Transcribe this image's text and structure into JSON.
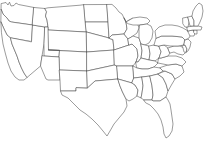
{
  "image": {
    "kind": "outline-map",
    "subject": "Contiguous United States",
    "width": 205,
    "height": 144,
    "has_labels": false,
    "has_legend": false,
    "has_title": false,
    "has_frame": false
  },
  "style": {
    "background_color": "#ffffff",
    "state_fill": "#ffffff",
    "border_color": "#4a4a4a",
    "border_width": 0.55
  },
  "map": {
    "projection_look": "albers-usa",
    "region_count": 49,
    "regions": [
      {
        "id": "WA",
        "name": "Washington",
        "d": "M1.5,3.5 L6,2.5 L8,5 L9.5,2.2 L11,6 L14,5.5 L16,3 L18.5,4.5 L34,7.5 L32.5,25 L11.5,22 L9,21 L7,18 L3,14 L1.2,9.5 Z"
      },
      {
        "id": "OR",
        "name": "Oregon",
        "d": "M1.2,9.5 L3,14 L7,18 L9,21 L11.5,22 L32.5,25 L31.5,41.5 L10.5,38 L7,35 L4,29 L1,22 Z"
      },
      {
        "id": "CA",
        "name": "California",
        "d": "M1,22 L4,29 L7,35 L10.5,38 L12,44 L14.5,50 L17,56 L19,62 L21.5,68 L24,73 L27,77.5 L24,80 L19,80 L15,77 L11,71 L8,63 L5.5,54 L3,44 L1.5,33 Z"
      },
      {
        "id": "NV",
        "name": "Nevada",
        "d": "M31.5,41.5 L32.5,25 L45,27 L44,44 L42,56 L40.5,66 L27,77.5 L24,73 L21.5,68 L19,62 L17,56 L14.5,50 L12,44 L10.5,38 Z"
      },
      {
        "id": "ID",
        "name": "Idaho",
        "d": "M34,7.5 L45,8.5 L46.5,12 L45.5,16 L47,20 L48,27 L45,27 L32.5,25 Z"
      },
      {
        "id": "MT",
        "name": "Montana",
        "d": "M45,8.5 L48,7.8 L80,5.2 L84,4.6 L85.5,22 L86.5,32 L48,30 L48,27 L47,20 L45.5,16 L46.5,12 Z"
      },
      {
        "id": "WY",
        "name": "Wyoming",
        "d": "M48,30 L86.5,32 L87,52 L48.5,50 Z"
      },
      {
        "id": "UT",
        "name": "Utah",
        "d": "M45,27 L48,27 L48,30 L48.5,50 L59.5,50.5 L59,57 L44,56 L44,44 Z"
      },
      {
        "id": "CO",
        "name": "Colorado",
        "d": "M48.5,50 L87,52 L87,71 L59.5,70 L59,57 L59.5,50.5 Z"
      },
      {
        "id": "AZ",
        "name": "Arizona",
        "d": "M44,56 L59,57 L59.5,70 L60,80 L48,80 L46,79 L40.5,66 L42,56 Z"
      },
      {
        "id": "NM",
        "name": "New Mexico",
        "d": "M59.5,70 L87,71 L87.5,88 L76,88 L76,91 L60.5,91 L60,80 Z"
      },
      {
        "id": "ND",
        "name": "North Dakota",
        "d": "M84,4.6 L107,4.5 L108,22 L85.5,22 Z"
      },
      {
        "id": "SD",
        "name": "South Dakota",
        "d": "M85.5,22 L108,22 L109,38 L86.5,32 Z"
      },
      {
        "id": "NE",
        "name": "Nebraska",
        "d": "M86.5,32 L109,38 L113,40 L114,50 L87,52 Z"
      },
      {
        "id": "KS",
        "name": "Kansas",
        "d": "M87,52 L114,50 L114.5,65 L87,71 Z"
      },
      {
        "id": "OK",
        "name": "Oklahoma",
        "d": "M87,71 L114.5,65 L117,66 L118,79 L95,81 L87.5,88 Z"
      },
      {
        "id": "TX",
        "name": "Texas",
        "d": "M87.5,88 L95,81 L118,79 L120,86 L122.5,92 L126,99 L127,106 L124,112 L119,118 L114,124 L110,131 L107,136 L103,131 L98,125 L92,119 L86,114 L80,110 L74,104 L68,98 L62,95 L60.5,91 L76,91 L76,88 Z"
      },
      {
        "id": "MN",
        "name": "Minnesota",
        "d": "M107,4.5 L112,4.4 L116,8 L119,12 L122,14 L124,18 L126,22 L127,29 L124,34 L112,35 L109,38 L108,22 Z"
      },
      {
        "id": "IA",
        "name": "Iowa",
        "d": "M109,38 L112,35 L124,34 L128,39 L129,45 L114,50 L113,40 Z"
      },
      {
        "id": "MO",
        "name": "Missouri",
        "d": "M114,50 L129,45 L132,44 L137,49 L138,56 L136,62 L133,66 L117,66 L114.5,65 Z"
      },
      {
        "id": "AR",
        "name": "Arkansas",
        "d": "M117,66 L133,66 L134,78 L132,83 L118,79 Z"
      },
      {
        "id": "LA",
        "name": "Louisiana",
        "d": "M118,79 L132,83 L135,85 L138,90 L137,96 L133,99 L129,101 L126,99 L122.5,92 L120,86 Z"
      },
      {
        "id": "WI",
        "name": "Wisconsin",
        "d": "M124,18 L126,22 L129,20 L133,18 L137,22 L139,28 L137,33 L133,36 L128,39 L124,34 L127,29 L126,22 Z"
      },
      {
        "id": "IL",
        "name": "Illinois",
        "d": "M128,39 L133,36 L139,38 L141,44 L142,51 L141,58 L138,62 L136,62 L138,56 L137,49 L132,44 L129,45 Z"
      },
      {
        "id": "MI-UP",
        "name": "Michigan Upper Peninsula",
        "d": "M126,22 L133,18 L140,17 L147,18 L150,21 L147,24 L140,25 L133,25 L129,24 Z"
      },
      {
        "id": "MI",
        "name": "Michigan",
        "d": "M140,25 L147,24 L151,26 L153,31 L152,38 L149,43 L145,45 L141,44 L139,38 L139,30 Z"
      },
      {
        "id": "IN",
        "name": "Indiana",
        "d": "M141,44 L145,45 L149,46 L150,54 L149,60 L141,58 L142,51 Z"
      },
      {
        "id": "OH",
        "name": "Ohio",
        "d": "M149,46 L154,45 L159,46 L161,52 L159,58 L155,61 L149,60 L150,54 Z"
      },
      {
        "id": "KY",
        "name": "Kentucky",
        "d": "M136,62 L138,62 L141,58 L149,60 L155,61 L158,63 L154,67 L148,69 L142,69 L137,68 Z"
      },
      {
        "id": "TN",
        "name": "Tennessee",
        "d": "M133,66 L137,68 L142,69 L148,69 L154,67 L160,68 L163,71 L158,74 L150,76 L142,77 L134,78 Z"
      },
      {
        "id": "MS",
        "name": "Mississippi",
        "d": "M134,78 L142,77 L143,86 L142,93 L141,98 L137,96 L138,90 L135,85 L132,83 Z"
      },
      {
        "id": "AL",
        "name": "Alabama",
        "d": "M142,77 L150,76 L152,86 L153,95 L152,100 L144,100 L141,98 L142,93 L143,86 Z"
      },
      {
        "id": "GA",
        "name": "Georgia",
        "d": "M150,76 L158,74 L163,78 L166,84 L168,91 L166,97 L160,101 L153,101 L152,100 L153,95 L152,86 Z"
      },
      {
        "id": "FL",
        "name": "Florida",
        "d": "M144,100 L152,100 L153,101 L160,101 L166,97 L168,100 L170,104 L171,110 L172,117 L173,124 L172,131 L169,136 L166,138 L164,134 L163,127 L161,120 L158,114 L154,109 L150,105 L146,103 Z"
      },
      {
        "id": "SC",
        "name": "South Carolina",
        "d": "M158,74 L165,71 L172,74 L175,79 L172,84 L168,91 L166,84 L163,78 Z"
      },
      {
        "id": "NC",
        "name": "North Carolina",
        "d": "M160,68 L163,71 L165,71 L172,74 L175,79 L180,76 L184,72 L182,66 L176,64 L168,65 Z"
      },
      {
        "id": "VA",
        "name": "Virginia",
        "d": "M158,63 L168,65 L176,64 L182,66 L186,62 L182,58 L176,56 L168,56 L161,58 L159,58 Z"
      },
      {
        "id": "WV",
        "name": "West Virginia",
        "d": "M159,46 L164,45 L168,48 L170,53 L168,56 L161,58 L159,58 L161,52 Z"
      },
      {
        "id": "MD",
        "name": "Maryland",
        "d": "M168,48 L174,46 L180,46 L184,48 L186,52 L183,55 L178,54 L174,52 L170,53 Z"
      },
      {
        "id": "DE",
        "name": "Delaware",
        "d": "M182,45 L185,45 L187,49 L186,53 L184,52 L183,48 Z"
      },
      {
        "id": "PA",
        "name": "Pennsylvania",
        "d": "M154,45 L156,38 L162,36 L172,36 L182,37 L185,40 L184,45 L178,46 L170,46 L164,45 L159,46 Z"
      },
      {
        "id": "NJ",
        "name": "New Jersey",
        "d": "M185,40 L188,39 L191,42 L190,47 L188,51 L186,52 L187,49 L185,45 L184,45 Z"
      },
      {
        "id": "NY",
        "name": "New York",
        "d": "M156,38 L155,31 L159,27 L165,25 L172,25 L178,26 L183,28 L188,31 L191,34 L189,38 L185,40 L182,37 L172,36 L162,36 Z"
      },
      {
        "id": "CT",
        "name": "Connecticut",
        "d": "M188,31 L193,30 L195,33 L194,36 L190,36 L189,34 Z"
      },
      {
        "id": "RI",
        "name": "Rhode Island",
        "d": "M194,30 L197,30 L197,34 L195,34 L194,33 Z"
      },
      {
        "id": "MA",
        "name": "Massachusetts",
        "d": "M187,27 L193,26 L198,26 L202,27 L201,30 L197,30 L193,30 L188,31 Z"
      },
      {
        "id": "VT",
        "name": "Vermont",
        "d": "M183,18 L188,17 L189,22 L188,27 L185,27 L183,24 Z"
      },
      {
        "id": "NH",
        "name": "New Hampshire",
        "d": "M188,17 L192,16 L194,21 L194,26 L190,26 L189,22 Z"
      },
      {
        "id": "ME",
        "name": "Maine",
        "d": "M192,16 L193,11 L196,6 L199,3 L202,5 L203,11 L202,17 L200,22 L198,26 L194,26 L194,21 Z"
      }
    ]
  }
}
